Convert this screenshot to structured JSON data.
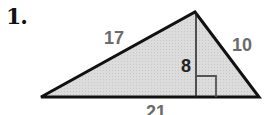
{
  "problem": {
    "number": "1."
  },
  "figure": {
    "type": "triangle",
    "fill_color": "#d9d9d9",
    "stroke_color": "#111111",
    "vertices": {
      "left": [
        41,
        97
      ],
      "top": [
        195,
        12
      ],
      "right": [
        259,
        97
      ]
    },
    "labels": {
      "left_side": "17",
      "right_side": "10",
      "height": "8",
      "base": "21"
    },
    "right_angle_marker": true
  }
}
